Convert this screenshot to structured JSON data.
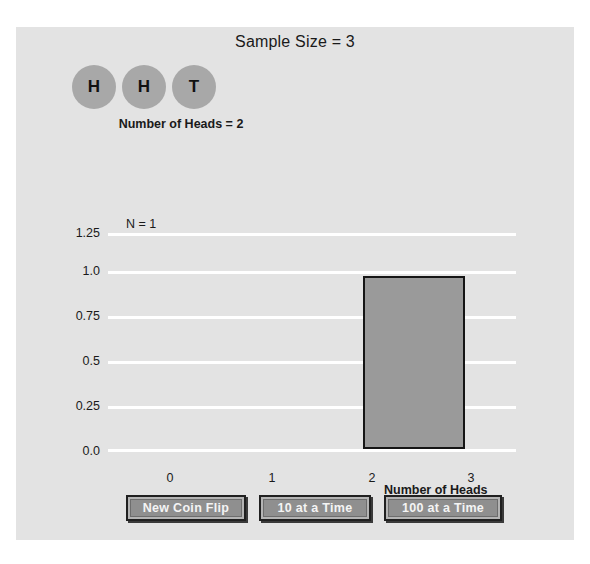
{
  "app": {
    "background": "#e3e3e3",
    "title": "Sample Size = 3"
  },
  "coins": {
    "items": [
      {
        "face": "H"
      },
      {
        "face": "H"
      },
      {
        "face": "T"
      }
    ],
    "summary": "Number of Heads = 2",
    "coin_color": "#a8a8a8"
  },
  "chart_data": {
    "type": "bar",
    "title": "",
    "xlabel": "Number of Heads",
    "ylabel": "",
    "categories": [
      "0",
      "1",
      "2",
      "3"
    ],
    "values": [
      0,
      0,
      1.0,
      0
    ],
    "ylim": [
      0.0,
      1.25
    ],
    "yticks": [
      "0.0",
      "0.25",
      "0.5",
      "0.75",
      "1.0",
      "1.25"
    ],
    "ytick_values": [
      0.0,
      0.25,
      0.5,
      0.75,
      1.0,
      1.25
    ],
    "xticks": [
      "0",
      "1",
      "2",
      "3"
    ],
    "grid": true,
    "gridline_color": "#ffffff",
    "bar_fill": "#9a9a9a",
    "bar_edge": "#151515",
    "annotation": "N = 1",
    "legend": null
  },
  "controls": {
    "buttons": [
      {
        "label": "New Coin Flip"
      },
      {
        "label": "10 at a Time"
      },
      {
        "label": "100 at a Time"
      }
    ]
  }
}
